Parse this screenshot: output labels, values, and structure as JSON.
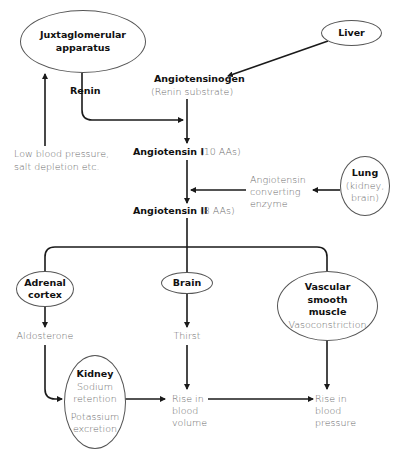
{
  "diagram": {
    "nodes": {
      "juxtaglomerular": {
        "label_line1": "Juxtaglomerular",
        "label_line2": "apparatus"
      },
      "liver": {
        "label": "Liver"
      },
      "lung": {
        "label": "Lung",
        "sub_line1": "(kidney,",
        "sub_line2": "brain)"
      },
      "adrenal": {
        "label_line1": "Adrenal",
        "label_line2": "cortex"
      },
      "brain": {
        "label": "Brain"
      },
      "vascular": {
        "label_line1": "Vascular",
        "label_line2": "smooth",
        "label_line3": "muscle",
        "sub": "Vasoconstriction"
      },
      "kidney": {
        "label": "Kidney",
        "sub_line1": "Sodium",
        "sub_line2": "retention",
        "sub_line3": "Potassium",
        "sub_line4": "excretion"
      }
    },
    "labels": {
      "renin": "Renin",
      "angiotensinogen": "Angiotensinogen",
      "renin_substrate": "(Renin substrate)",
      "low_bp_line1": "Low blood pressure,",
      "low_bp_line2": "salt depletion etc.",
      "angiotensin1": "Angiotensin I",
      "angiotensin1_aas": "(10 AAs)",
      "ace_line1": "Angiotensin",
      "ace_line2": "converting",
      "ace_line3": "enzyme",
      "angiotensin2": "Angiotensin II",
      "angiotensin2_aas": "(8 AAs)",
      "aldosterone": "Aldosterone",
      "thirst": "Thirst",
      "rise_volume_line1": "Rise in",
      "rise_volume_line2": "blood",
      "rise_volume_line3": "volume",
      "rise_pressure_line1": "Rise in",
      "rise_pressure_line2": "blood",
      "rise_pressure_line3": "pressure"
    },
    "colors": {
      "line": "#1a1a1a",
      "node_border": "#555555",
      "bold_text": "#111111",
      "grey_text": "#6b6b6b"
    }
  }
}
